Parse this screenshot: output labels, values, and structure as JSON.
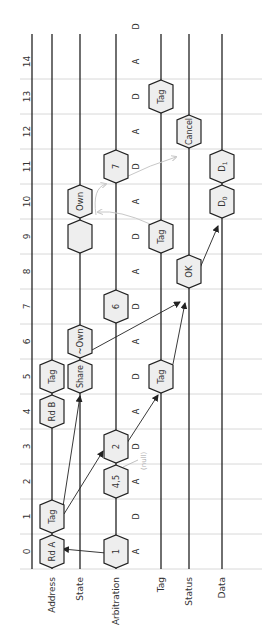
{
  "diagram": {
    "type": "rotated-timing-diagram",
    "lanes": [
      {
        "id": "address",
        "label": "Address",
        "x": 52
      },
      {
        "id": "state",
        "label": "State",
        "x": 80
      },
      {
        "id": "arbitration",
        "label": "Arbitration",
        "x": 116
      },
      {
        "id": "tag",
        "label": "Tag",
        "x": 161
      },
      {
        "id": "status",
        "label": "Status",
        "x": 189
      },
      {
        "id": "data",
        "label": "Data",
        "x": 222
      }
    ],
    "cycles": [
      "0",
      "1",
      "2",
      "3",
      "4",
      "5",
      "6",
      "7",
      "8",
      "9",
      "10",
      "11",
      "12",
      "13",
      "14"
    ],
    "arbitration_phases": [
      "A",
      "D",
      "A",
      "D",
      "A",
      "D",
      "A",
      "D",
      "A",
      "D",
      "A",
      "D",
      "A",
      "D",
      "A",
      "D"
    ],
    "blocks": [
      {
        "lane": "address",
        "label": "Rd A",
        "start": 0,
        "end": 1
      },
      {
        "lane": "address",
        "label": "Tag",
        "start": 1,
        "end": 2
      },
      {
        "lane": "address",
        "label": "Rd B",
        "start": 4,
        "end": 5
      },
      {
        "lane": "address",
        "label": "Tag",
        "start": 5,
        "end": 6
      },
      {
        "lane": "state",
        "label": "Share",
        "start": 5,
        "end": 6
      },
      {
        "lane": "state",
        "label": "~Own",
        "start": 6,
        "end": 7
      },
      {
        "lane": "state",
        "label": "",
        "start": 9,
        "end": 10
      },
      {
        "lane": "state",
        "label": "Own",
        "start": 10,
        "end": 11
      },
      {
        "lane": "arbitration",
        "label": "1",
        "start": 0,
        "end": 1
      },
      {
        "lane": "arbitration",
        "label": "4,5",
        "start": 2,
        "end": 3
      },
      {
        "lane": "arbitration",
        "label": "2",
        "start": 3,
        "end": 4
      },
      {
        "lane": "arbitration",
        "label": "6",
        "start": 7,
        "end": 8
      },
      {
        "lane": "arbitration",
        "label": "7",
        "start": 11,
        "end": 12
      },
      {
        "lane": "tag",
        "label": "Tag",
        "start": 5,
        "end": 6
      },
      {
        "lane": "tag",
        "label": "Tag",
        "start": 9,
        "end": 10
      },
      {
        "lane": "tag",
        "label": "Tag",
        "start": 13,
        "end": 14
      },
      {
        "lane": "status",
        "label": "OK",
        "start": 8,
        "end": 9
      },
      {
        "lane": "status",
        "label": "Cancel",
        "start": 12,
        "end": 13
      },
      {
        "lane": "data",
        "label": "D0",
        "start": 10,
        "end": 11
      },
      {
        "lane": "data",
        "label": "D1",
        "start": 11,
        "end": 12
      }
    ],
    "annotations": [
      {
        "text": "(null)",
        "near": "4,5",
        "color": "#b0b0b0"
      }
    ],
    "colors": {
      "lane_line": "#222222",
      "grid_line": "#d8d8d8",
      "block_fill": "#eeeeee",
      "block_stroke": "#222222",
      "arrow": "#333333",
      "faint_arrow": "#c8c8c8",
      "text": "#333333"
    }
  }
}
